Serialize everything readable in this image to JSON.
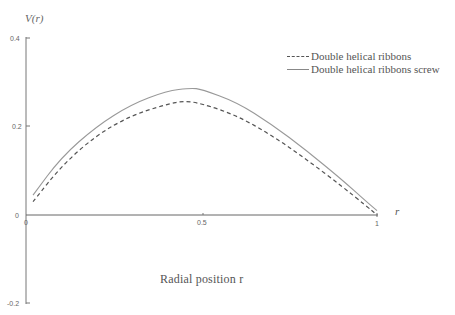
{
  "chart_data": {
    "type": "line",
    "title": "",
    "xlabel": "Radial position r",
    "ylabel": "V(r)",
    "x_axis_end_label": "r",
    "xlim": [
      0,
      1
    ],
    "ylim": [
      -0.2,
      0.4
    ],
    "x_ticks": [
      "0",
      "0.5",
      "1"
    ],
    "y_ticks": [
      "0.4",
      "0.2",
      "0",
      "-0.2"
    ],
    "grid": false,
    "legend_position": "upper right",
    "series": [
      {
        "name": "Double helical ribbons",
        "style": "dashed",
        "x": [
          0.02,
          0.1,
          0.2,
          0.3,
          0.4,
          0.45,
          0.5,
          0.6,
          0.7,
          0.8,
          0.9,
          0.97,
          1.0
        ],
        "values": [
          0.03,
          0.11,
          0.18,
          0.225,
          0.25,
          0.258,
          0.252,
          0.225,
          0.18,
          0.125,
          0.065,
          0.02,
          0.0
        ]
      },
      {
        "name": "Double helical ribbons screw",
        "style": "solid",
        "x": [
          0.02,
          0.1,
          0.2,
          0.3,
          0.4,
          0.47,
          0.5,
          0.6,
          0.7,
          0.8,
          0.9,
          0.97,
          1.0
        ],
        "values": [
          0.045,
          0.13,
          0.2,
          0.25,
          0.28,
          0.287,
          0.284,
          0.255,
          0.205,
          0.145,
          0.08,
          0.03,
          0.01
        ]
      }
    ]
  },
  "axis": {
    "ylabel": "V(r)",
    "xlabel": "Radial position r",
    "x_end": "r",
    "ticks_y": [
      "0.4",
      "0.2",
      "0",
      "-0.2"
    ],
    "ticks_x": [
      "0",
      "0.5",
      "1"
    ]
  },
  "legend": {
    "items": [
      {
        "label": "Double helical ribbons"
      },
      {
        "label": "Double helical ribbons screw"
      }
    ]
  }
}
